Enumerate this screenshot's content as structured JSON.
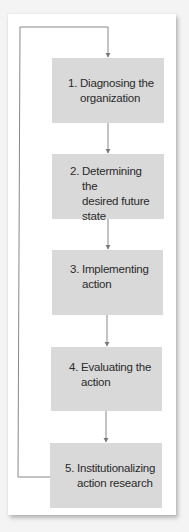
{
  "diagram": {
    "type": "flowchart",
    "colors": {
      "background": "#f4f4f4",
      "panel": "#ffffff",
      "box_fill": "#d9d9d9",
      "line": "#7a7a7a",
      "text": "#2a2a2a"
    },
    "steps": [
      {
        "number": "1.",
        "lines": [
          "Diagnosing the",
          "organization"
        ]
      },
      {
        "number": "2.",
        "lines": [
          "Determining the",
          "desired future",
          "state"
        ]
      },
      {
        "number": "3.",
        "lines": [
          "Implementing",
          "action"
        ]
      },
      {
        "number": "4.",
        "lines": [
          "Evaluating the",
          "action"
        ]
      },
      {
        "number": "5.",
        "lines": [
          "Institutionalizing",
          "action research"
        ]
      }
    ],
    "connections": [
      {
        "from": "1",
        "to": "2",
        "type": "arrow"
      },
      {
        "from": "2",
        "to": "3",
        "type": "arrow"
      },
      {
        "from": "3",
        "to": "4",
        "type": "arrow"
      },
      {
        "from": "4",
        "to": "5",
        "type": "arrow"
      },
      {
        "from": "5",
        "to": "1",
        "type": "feedback-loop-arrow"
      }
    ]
  }
}
